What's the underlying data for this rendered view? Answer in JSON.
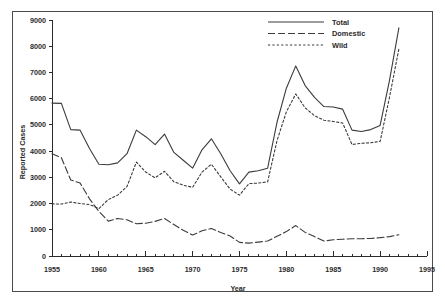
{
  "chart_data": {
    "type": "line",
    "title": "",
    "xlabel": "Year",
    "ylabel": "Reported Cases",
    "xlim": [
      1955,
      1995
    ],
    "ylim": [
      0,
      9000
    ],
    "grid": false,
    "legend_position": "top-right",
    "x_major_ticks": [
      1955,
      1960,
      1965,
      1970,
      1975,
      1980,
      1985,
      1990,
      1995
    ],
    "x_tick_labels": [
      "1955",
      "1960",
      "1965",
      "1970",
      "1975",
      "1980",
      "1985",
      "1990",
      "1995"
    ],
    "x_minor_tick_step": 1,
    "y_major_ticks": [
      0,
      1000,
      2000,
      3000,
      4000,
      5000,
      6000,
      7000,
      8000,
      9000
    ],
    "y_tick_labels": [
      "0",
      "1000",
      "2000",
      "3000",
      "4000",
      "5000",
      "6000",
      "7000",
      "8000",
      "9000"
    ],
    "x": [
      1955,
      1956,
      1957,
      1958,
      1959,
      1960,
      1961,
      1962,
      1963,
      1964,
      1965,
      1966,
      1967,
      1968,
      1969,
      1970,
      1971,
      1972,
      1973,
      1974,
      1975,
      1976,
      1977,
      1978,
      1979,
      1980,
      1981,
      1982,
      1983,
      1984,
      1985,
      1986,
      1987,
      1988,
      1989,
      1990,
      1991,
      1992
    ],
    "series": [
      {
        "name": "Total",
        "style": "solid",
        "color": "#3b3b3b",
        "values": [
          5830,
          5820,
          4820,
          4800,
          4100,
          3500,
          3480,
          3550,
          3900,
          4800,
          4550,
          4250,
          4650,
          3950,
          3650,
          3350,
          4050,
          4470,
          3900,
          3250,
          2750,
          3200,
          3250,
          3350,
          5100,
          6400,
          7250,
          6500,
          6050,
          5700,
          5680,
          5600,
          4800,
          4750,
          4820,
          4980,
          6700,
          8700
        ]
      },
      {
        "name": "Domestic",
        "style": "dashed",
        "color": "#3b3b3b",
        "values": [
          3900,
          3750,
          2900,
          2780,
          2180,
          1700,
          1330,
          1430,
          1380,
          1230,
          1250,
          1320,
          1430,
          1200,
          980,
          800,
          960,
          1050,
          900,
          760,
          520,
          490,
          530,
          570,
          750,
          930,
          1160,
          900,
          740,
          570,
          620,
          640,
          660,
          660,
          670,
          700,
          740,
          810
        ]
      },
      {
        "name": "Wild",
        "style": "dotted",
        "color": "#3b3b3b",
        "values": [
          1990,
          1980,
          2060,
          2000,
          1960,
          1810,
          2150,
          2320,
          2650,
          3580,
          3200,
          2980,
          3230,
          2830,
          2700,
          2620,
          3200,
          3500,
          3020,
          2550,
          2320,
          2760,
          2780,
          2830,
          4400,
          5500,
          6180,
          5650,
          5350,
          5180,
          5130,
          5070,
          4250,
          4300,
          4320,
          4370,
          6050,
          7900
        ]
      }
    ]
  },
  "legend": {
    "entries": [
      {
        "label": "Total",
        "style": "solid"
      },
      {
        "label": "Domestic",
        "style": "dashed"
      },
      {
        "label": "Wild",
        "style": "dotted"
      }
    ]
  }
}
